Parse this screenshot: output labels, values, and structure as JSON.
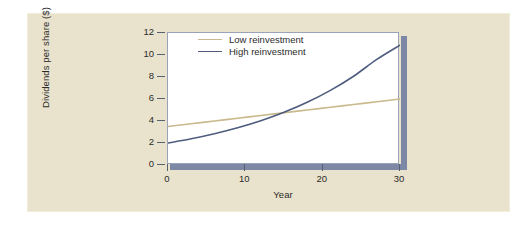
{
  "figure": {
    "card_bg": "#e9e3cd",
    "card_border": "#f2eeda",
    "plot_bg": "#ffffff",
    "plot_border": "#9aa3b8",
    "shadow_color": "#7c88a6"
  },
  "chart_data": {
    "type": "line",
    "title": "",
    "subtitle": "",
    "xlabel": "Year",
    "ylabel": "Dividends per share ($)",
    "xlim": [
      0,
      30
    ],
    "ylim": [
      0,
      12
    ],
    "xticks": [
      0,
      10,
      20,
      30
    ],
    "xtick_labels": [
      "0",
      "10",
      "20",
      "30"
    ],
    "yticks": [
      0,
      2,
      4,
      6,
      8,
      10,
      12
    ],
    "ytick_labels": [
      "0",
      "2",
      "4",
      "6",
      "8",
      "10",
      "12"
    ],
    "grid": false,
    "legend_position": "top-left-inside",
    "annotations": [],
    "series": [
      {
        "name": "Low reinvestment",
        "color": "#c9b98c",
        "line_width": 1.6,
        "x": [
          0,
          3,
          6,
          9,
          12,
          15,
          18,
          21,
          24,
          27,
          30
        ],
        "values": [
          3.5,
          3.75,
          4.0,
          4.25,
          4.5,
          4.75,
          5.0,
          5.25,
          5.5,
          5.75,
          6.0
        ]
      },
      {
        "name": "High reinvestment",
        "color": "#4e5c7e",
        "line_width": 1.6,
        "x": [
          0,
          3,
          6,
          9,
          12,
          15,
          18,
          21,
          24,
          27,
          30
        ],
        "values": [
          2.0,
          2.38,
          2.84,
          3.38,
          4.02,
          4.79,
          5.7,
          6.78,
          8.07,
          9.6,
          10.9
        ]
      }
    ],
    "crossover": {
      "x": 13.7,
      "y": 4.5
    }
  },
  "legend": {
    "entries": [
      {
        "label": "Low reinvestment",
        "color": "#c9b98c"
      },
      {
        "label": "High reinvestment",
        "color": "#4e5c7e"
      }
    ]
  }
}
